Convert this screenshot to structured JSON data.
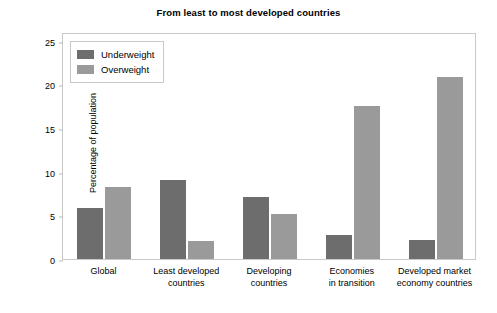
{
  "chart_data": {
    "type": "bar",
    "title": "From least to most developed countries",
    "xlabel": "",
    "ylabel": "Percentage of population",
    "ylim": [
      0,
      26
    ],
    "yticks": [
      0,
      5,
      10,
      15,
      20,
      25
    ],
    "ytick_labels": [
      "0",
      "5",
      "10",
      "15",
      "20",
      "25"
    ],
    "grid": false,
    "legend_position": "upper left",
    "categories": [
      "Global",
      "Least developed countries",
      "Developing countries",
      "Economies in transition",
      "Developed market economy countries"
    ],
    "category_lines": [
      [
        "Global"
      ],
      [
        "Least developed",
        "countries"
      ],
      [
        "Developing",
        "countries"
      ],
      [
        "Economies",
        "in transition"
      ],
      [
        "Developed market",
        "economy countries"
      ]
    ],
    "series": [
      {
        "name": "Underweight",
        "color": "#6d6d6d",
        "values": [
          5.9,
          9.1,
          7.1,
          2.7,
          2.2
        ]
      },
      {
        "name": "Overweight",
        "color": "#9a9a9a",
        "values": [
          8.3,
          2.1,
          5.2,
          17.5,
          20.8
        ]
      }
    ]
  },
  "legend": {
    "items": [
      {
        "label": "Underweight",
        "color": "#6d6d6d"
      },
      {
        "label": "Overweight",
        "color": "#9a9a9a"
      }
    ]
  }
}
